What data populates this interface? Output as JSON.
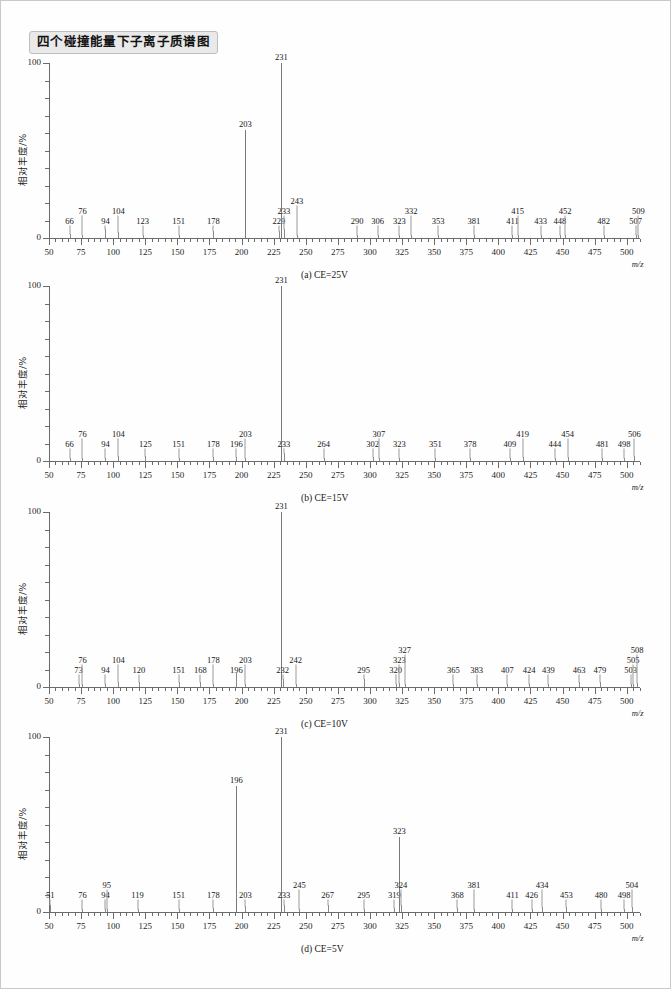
{
  "figure": {
    "title": "四个碰撞能量下子离子质谱图",
    "ylabel": "相对丰度/%",
    "xlabel": "m/z",
    "y_top_label": "100",
    "y_zero_label": "0",
    "x_tick_labels": [
      "50",
      "75",
      "100",
      "125",
      "150",
      "175",
      "200",
      "225",
      "250",
      "275",
      "300",
      "325",
      "350",
      "375",
      "400",
      "425",
      "450",
      "475",
      "500"
    ],
    "peak_color": "#8a8a8a",
    "axis_color": "#6b6b6b",
    "badge_bg": "#e9e9e9"
  },
  "chart_data": [
    {
      "type": "bar",
      "panel_id": "a",
      "caption": "(a) CE=25V",
      "title": "四个碰撞能量下子离子质谱图",
      "xlabel": "m/z",
      "ylabel": "相对丰度/%",
      "xlim": [
        50,
        515
      ],
      "ylim": [
        0,
        100
      ],
      "grid": false,
      "legend": "none",
      "x": [
        66,
        76,
        94,
        104,
        123,
        151,
        178,
        203,
        229,
        231,
        233,
        243,
        290,
        306,
        323,
        332,
        353,
        381,
        411,
        415,
        433,
        448,
        452,
        482,
        507,
        509
      ],
      "values": [
        2.5,
        2.0,
        5.0,
        3.5,
        1.8,
        2.0,
        4.0,
        62.0,
        4.0,
        100.0,
        5.0,
        2.0,
        1.8,
        1.6,
        1.6,
        2.0,
        2.0,
        1.5,
        1.5,
        1.8,
        1.5,
        1.5,
        1.8,
        1.5,
        1.6,
        1.8
      ],
      "labels": [
        "66",
        "76",
        "94",
        "104",
        "123",
        "151",
        "178",
        "203",
        "229",
        "231",
        "233",
        "243",
        "290",
        "306",
        "323",
        "332",
        "353",
        "381",
        "411",
        "415",
        "433",
        "448",
        "452",
        "482",
        "507",
        "509"
      ]
    },
    {
      "type": "bar",
      "panel_id": "b",
      "caption": "(b) CE=15V",
      "title": "四个碰撞能量下子离子质谱图",
      "xlabel": "m/z",
      "ylabel": "相对丰度/%",
      "xlim": [
        50,
        515
      ],
      "ylim": [
        0,
        100
      ],
      "grid": false,
      "legend": "none",
      "x": [
        66,
        76,
        94,
        104,
        125,
        151,
        178,
        196,
        203,
        231,
        233,
        264,
        302,
        307,
        323,
        351,
        378,
        409,
        419,
        444,
        454,
        481,
        498,
        506
      ],
      "values": [
        1.8,
        1.8,
        2.0,
        3.0,
        3.0,
        1.5,
        2.5,
        2.5,
        2.0,
        100.0,
        4.5,
        1.5,
        2.2,
        1.8,
        1.6,
        1.5,
        1.5,
        1.6,
        2.5,
        1.6,
        2.5,
        1.8,
        1.8,
        3.0
      ],
      "labels": [
        "66",
        "76",
        "94",
        "104",
        "125",
        "151",
        "178",
        "196",
        "203",
        "231",
        "233",
        "264",
        "302",
        "307",
        "323",
        "351",
        "378",
        "409",
        "419",
        "444",
        "454",
        "481",
        "498",
        "506"
      ]
    },
    {
      "type": "bar",
      "panel_id": "c",
      "caption": "(c) CE=10V",
      "title": "四个碰撞能量下子离子质谱图",
      "xlabel": "m/z",
      "ylabel": "相对丰度/%",
      "xlim": [
        50,
        515
      ],
      "ylim": [
        0,
        100
      ],
      "grid": false,
      "legend": "none",
      "x": [
        73,
        76,
        94,
        104,
        120,
        151,
        168,
        178,
        196,
        203,
        231,
        232,
        242,
        295,
        320,
        323,
        327,
        365,
        383,
        407,
        424,
        439,
        463,
        479,
        503,
        505,
        508
      ],
      "values": [
        2.0,
        1.8,
        1.8,
        3.0,
        3.0,
        3.0,
        3.0,
        2.0,
        8.0,
        1.8,
        100.0,
        4.5,
        2.0,
        4.5,
        2.0,
        2.5,
        2.0,
        1.6,
        1.8,
        1.6,
        1.6,
        1.8,
        3.0,
        3.0,
        1.8,
        2.0,
        2.2
      ],
      "labels": [
        "73",
        "76",
        "94",
        "104",
        "120",
        "151",
        "168",
        "178",
        "196",
        "203",
        "231",
        "232",
        "242",
        "295",
        "320",
        "323",
        "327",
        "365",
        "383",
        "407",
        "424",
        "439",
        "463",
        "479",
        "503",
        "505",
        "508"
      ]
    },
    {
      "type": "bar",
      "panel_id": "d",
      "caption": "(d) CE=5V",
      "title": "四个碰撞能量下子离子质谱图",
      "xlabel": "m/z",
      "ylabel": "相对丰度/%",
      "xlim": [
        50,
        515
      ],
      "ylim": [
        0,
        100
      ],
      "grid": false,
      "legend": "none",
      "x": [
        51,
        76,
        94,
        95,
        119,
        151,
        178,
        196,
        203,
        231,
        233,
        245,
        267,
        295,
        319,
        323,
        324,
        368,
        381,
        411,
        426,
        434,
        453,
        480,
        498,
        504
      ],
      "values": [
        4.0,
        1.8,
        2.0,
        2.0,
        2.0,
        1.8,
        2.5,
        72.0,
        3.5,
        100.0,
        4.0,
        2.0,
        4.0,
        1.8,
        2.5,
        43.0,
        4.0,
        2.5,
        1.8,
        1.6,
        1.8,
        3.0,
        3.0,
        1.8,
        1.8,
        3.0
      ],
      "labels": [
        "51",
        "76",
        "94",
        "95",
        "119",
        "151",
        "178",
        "196",
        "203",
        "231",
        "233",
        "245",
        "267",
        "295",
        "319",
        "323",
        "324",
        "368",
        "381",
        "411",
        "426",
        "434",
        "453",
        "480",
        "498",
        "504"
      ]
    }
  ]
}
